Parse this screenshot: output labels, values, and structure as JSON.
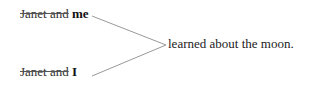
{
  "diagram": {
    "subjects": [
      {
        "struck_text": "Janet and",
        "bold_text": "me"
      },
      {
        "struck_text": "Janet and",
        "bold_text": "I"
      }
    ],
    "predicate": "learned about the moon.",
    "colors": {
      "text": "#222222",
      "connector": "#999999",
      "strikethrough": "#555555"
    }
  }
}
